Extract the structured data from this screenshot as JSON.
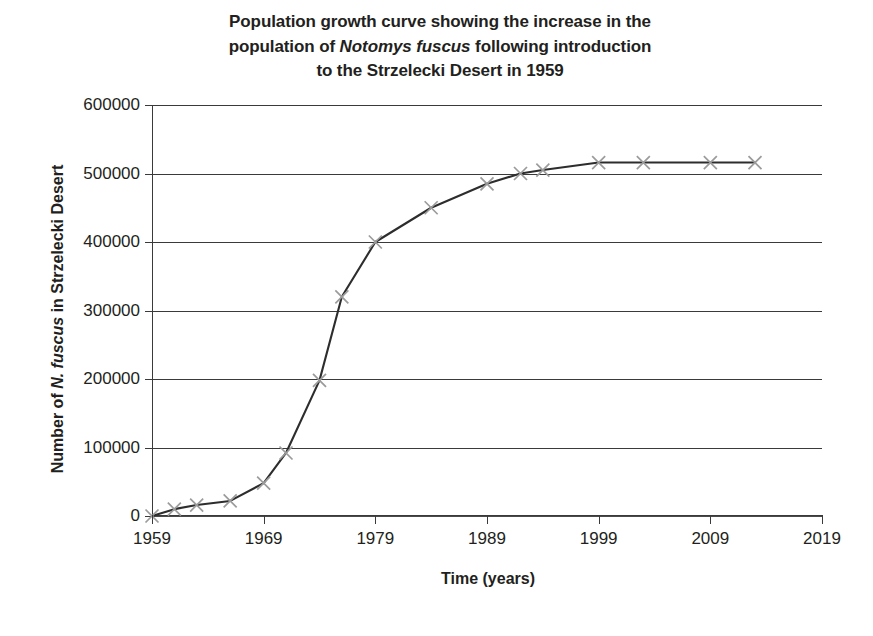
{
  "chart_data": {
    "type": "line",
    "title": "Population growth curve showing the increase in the population of Notomys fuscus following introduction to the Strzelecki Desert in 1959",
    "title_line1": "Population growth curve showing the increase in the",
    "title_line2_pre": "population of ",
    "title_line2_sci": "Notomys fuscus",
    "title_line2_post": " following introduction",
    "title_line3": "to the Strzelecki Desert in 1959",
    "xlabel": "Time (years)",
    "ylabel": "Number of N. fuscus in Strzelecki Desert",
    "ylabel_pre": "Number of ",
    "ylabel_sci": "N. fuscus",
    "ylabel_post": " in Strzelecki Desert",
    "xlim": [
      1959,
      2019
    ],
    "ylim": [
      0,
      600000
    ],
    "grid": true,
    "legend": "none",
    "line_color": "#2d2d2d",
    "marker_color": "#9b9b9b",
    "marker_style": "x",
    "xticks": [
      1959,
      1969,
      1979,
      1989,
      1999,
      2009,
      2019
    ],
    "xtick_labels": [
      "1959",
      "1969",
      "1979",
      "1989",
      "1999",
      "2009",
      "2019"
    ],
    "yticks": [
      0,
      100000,
      200000,
      300000,
      400000,
      500000,
      600000
    ],
    "ytick_labels": [
      "0",
      "100000",
      "200000",
      "300000",
      "400000",
      "500000",
      "600000"
    ],
    "x": [
      1959,
      1961,
      1963,
      1966,
      1969,
      1971,
      1974,
      1976,
      1979,
      1984,
      1989,
      1992,
      1994,
      1999,
      2003,
      2009,
      2013
    ],
    "y": [
      0,
      10000,
      16000,
      22000,
      48000,
      92000,
      198000,
      320000,
      400000,
      450000,
      485000,
      500000,
      505000,
      516000,
      516000,
      516000,
      516000
    ],
    "points": [
      {
        "x": 1959,
        "y": 0
      },
      {
        "x": 1961,
        "y": 10000
      },
      {
        "x": 1963,
        "y": 16000
      },
      {
        "x": 1966,
        "y": 22000
      },
      {
        "x": 1969,
        "y": 48000
      },
      {
        "x": 1971,
        "y": 92000
      },
      {
        "x": 1974,
        "y": 198000
      },
      {
        "x": 1976,
        "y": 320000
      },
      {
        "x": 1979,
        "y": 400000
      },
      {
        "x": 1984,
        "y": 450000
      },
      {
        "x": 1989,
        "y": 485000
      },
      {
        "x": 1992,
        "y": 500000
      },
      {
        "x": 1994,
        "y": 505000
      },
      {
        "x": 1999,
        "y": 516000
      },
      {
        "x": 2003,
        "y": 516000
      },
      {
        "x": 2009,
        "y": 516000
      },
      {
        "x": 2013,
        "y": 516000
      }
    ]
  }
}
